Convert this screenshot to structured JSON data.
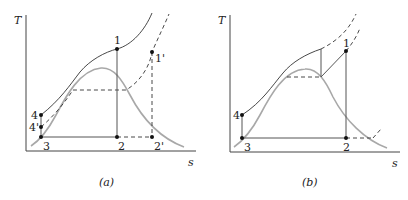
{
  "figure": {
    "panels": [
      {
        "id": "a",
        "caption": "(a)",
        "y_axis_label": "T",
        "x_axis_label": "s",
        "points": [
          {
            "label": "1"
          },
          {
            "label": "1'"
          },
          {
            "label": "2"
          },
          {
            "label": "2'"
          },
          {
            "label": "3"
          },
          {
            "label": "4"
          },
          {
            "label": "4'"
          }
        ]
      },
      {
        "id": "b",
        "caption": "(b)",
        "y_axis_label": "T",
        "x_axis_label": "s",
        "points": [
          {
            "label": "1"
          },
          {
            "label": "2"
          },
          {
            "label": "3"
          },
          {
            "label": "4"
          }
        ]
      }
    ]
  }
}
